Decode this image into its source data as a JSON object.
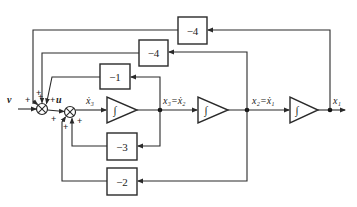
{
  "diagram": {
    "type": "block-diagram",
    "title": "",
    "inputs": {
      "v": "v",
      "u": "u"
    },
    "gains": {
      "top_outer": "−4",
      "top_inner": "−4",
      "inner_top": "−1",
      "inner_bottom": "−3",
      "bottom": "−2"
    },
    "integrator_symbol": "∫",
    "signals": {
      "x3dot": "ẋ₃",
      "x3_eq": "x₃=ẋ₂",
      "x2_eq": "x₂=ẋ₁",
      "x1": "x₁"
    },
    "signs": {
      "s1_v": "+",
      "s1_top_a": "+",
      "s1_top_b": "+",
      "s1_u": "+",
      "s2_left": "+",
      "s2_bottom_a": "+",
      "s2_bottom_b": "+"
    },
    "colors": {
      "stroke": "#2a2a2a",
      "background": "#ffffff"
    }
  }
}
